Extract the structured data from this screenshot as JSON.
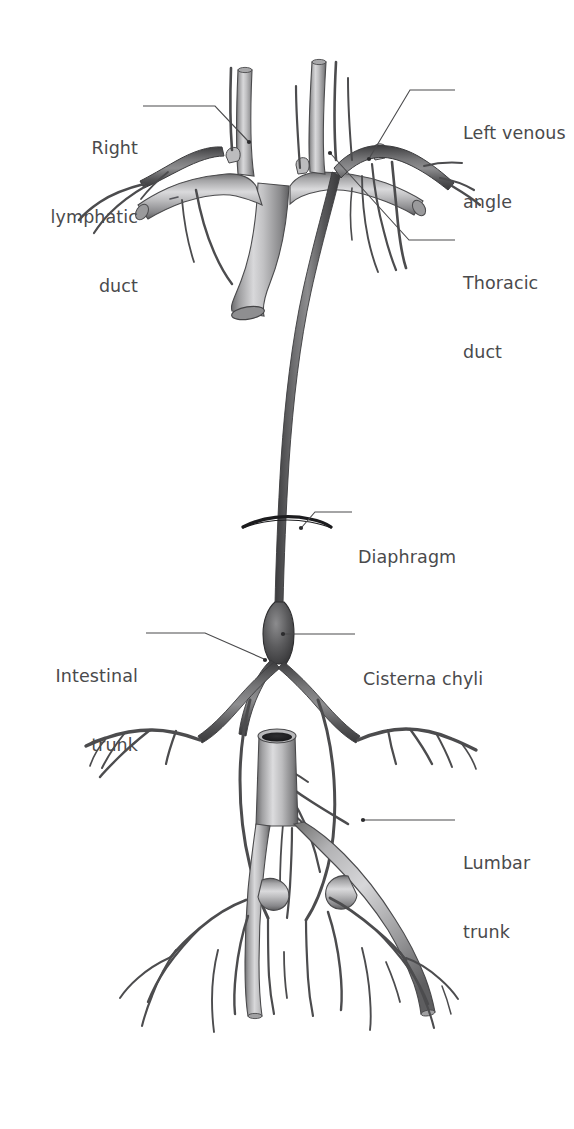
{
  "figure": {
    "background_color": "#ffffff",
    "width": 574,
    "height": 1129,
    "label_color": "#4a4a4c",
    "leader_line_color": "#4a4a4c",
    "vein_color_light": "#b4b4b6",
    "lymphatic_color_dark": "#5e5e60"
  },
  "labels": {
    "right_lymphatic_duct": {
      "line1": "Right",
      "line2": "lymphatic",
      "line3": "duct",
      "align": "right",
      "x": 18,
      "y": 91,
      "width": 120
    },
    "left_venous_angle": {
      "line1": "Left venous",
      "line2": "angle",
      "align": "left",
      "x": 463,
      "y": 76,
      "width": 110
    },
    "thoracic_duct": {
      "line1": "Thoracic",
      "line2": "duct",
      "align": "left",
      "x": 463,
      "y": 226,
      "width": 110
    },
    "diaphragm": {
      "line1": "Diaphragm",
      "align": "left",
      "x": 358,
      "y": 500,
      "width": 130
    },
    "intestinal_trunk": {
      "line1": "Intestinal",
      "line2": "trunk",
      "align": "right",
      "x": 28,
      "y": 619,
      "width": 110
    },
    "cisterna_chyli": {
      "line1": "Cisterna chyli",
      "align": "left",
      "x": 363,
      "y": 622,
      "width": 150
    },
    "lumbar_trunk": {
      "line1": "Lumbar",
      "line2": "trunk",
      "align": "left",
      "x": 463,
      "y": 806,
      "width": 110
    }
  },
  "structures": [
    {
      "name": "superior-vena-cava",
      "type": "vein",
      "shading": "light"
    },
    {
      "name": "right-brachiocephalic-vein",
      "type": "vein",
      "shading": "light"
    },
    {
      "name": "left-brachiocephalic-vein",
      "type": "vein",
      "shading": "light"
    },
    {
      "name": "right-internal-jugular-vein",
      "type": "vein",
      "shading": "light"
    },
    {
      "name": "left-internal-jugular-vein",
      "type": "vein",
      "shading": "light"
    },
    {
      "name": "right-subclavian-vein",
      "type": "vein",
      "shading": "light"
    },
    {
      "name": "left-subclavian-vein",
      "type": "vein",
      "shading": "light"
    },
    {
      "name": "thoracic-duct",
      "type": "lymphatic",
      "shading": "dark"
    },
    {
      "name": "right-lymphatic-duct",
      "type": "lymphatic",
      "shading": "dark"
    },
    {
      "name": "cisterna-chyli",
      "type": "lymphatic",
      "shading": "dark"
    },
    {
      "name": "intestinal-trunk",
      "type": "lymphatic",
      "shading": "dark"
    },
    {
      "name": "left-lumbar-trunk",
      "type": "lymphatic",
      "shading": "dark"
    },
    {
      "name": "right-lumbar-trunk",
      "type": "lymphatic",
      "shading": "dark"
    },
    {
      "name": "inferior-vena-cava",
      "type": "vein",
      "shading": "light"
    },
    {
      "name": "right-common-iliac-vein",
      "type": "vein",
      "shading": "light"
    },
    {
      "name": "left-common-iliac-vein",
      "type": "vein",
      "shading": "light"
    },
    {
      "name": "diaphragm-outline",
      "type": "muscle",
      "shading": "line"
    }
  ]
}
